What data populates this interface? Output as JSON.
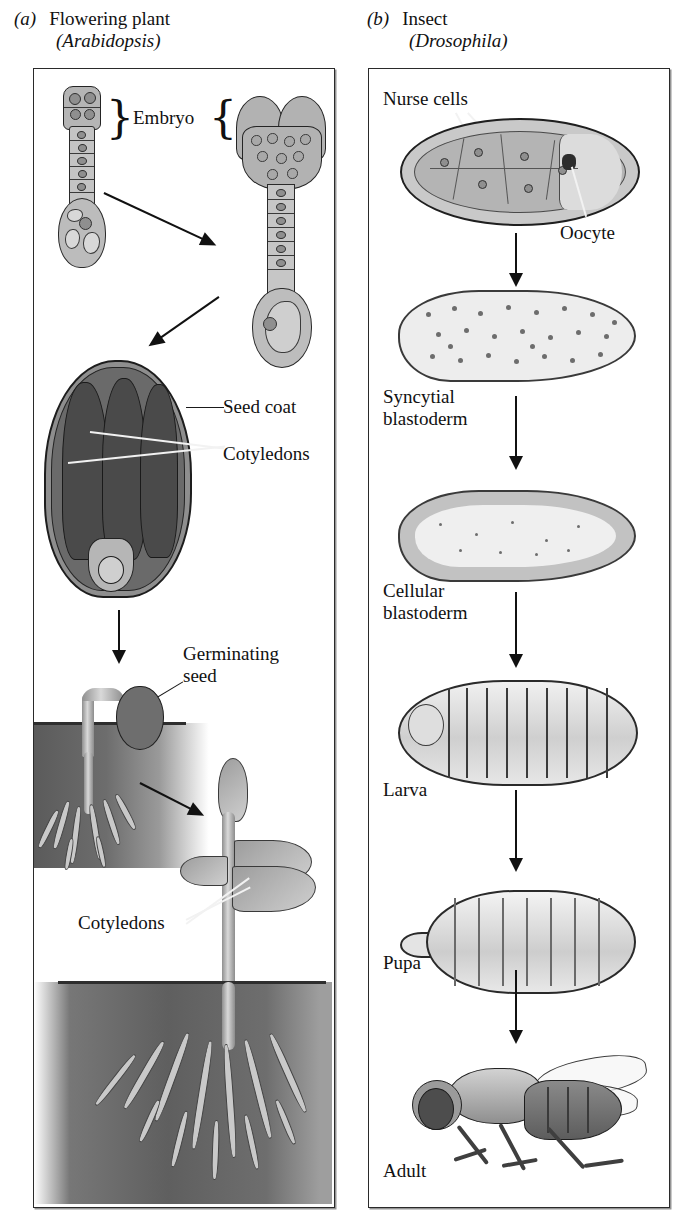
{
  "figure": {
    "type": "comparative-development-diagram",
    "panels": [
      {
        "tag": "(a)",
        "title": "Flowering plant",
        "organism": "(Arabidopsis)",
        "labels": {
          "embryo": "Embryo",
          "seed_coat": "Seed coat",
          "cotyledons_seed": "Cotyledons",
          "germinating_seed_line1": "Germinating",
          "germinating_seed_line2": "seed",
          "cotyledons_seedling": "Cotyledons"
        },
        "stages": [
          "early globular embryo with suspensor",
          "heart-stage embryo with suspensor",
          "mature seed",
          "germinating seedling in soil",
          "young seedling with cotyledons"
        ]
      },
      {
        "tag": "(b)",
        "title": "Insect",
        "organism": "(Drosophila)",
        "labels": {
          "nurse_cells": "Nurse cells",
          "oocyte": "Oocyte",
          "syncytial_line1": "Syncytial",
          "syncytial_line2": "blastoderm",
          "cellular_line1": "Cellular",
          "cellular_line2": "blastoderm",
          "larva": "Larva",
          "pupa": "Pupa",
          "adult": "Adult"
        },
        "stages": [
          "egg chamber with nurse cells and oocyte",
          "syncytial blastoderm",
          "cellular blastoderm",
          "larva",
          "pupa",
          "adult"
        ]
      }
    ],
    "colors": {
      "ink": "#111111",
      "frame": "#2a2a2a",
      "paper": "#ffffff",
      "tissue_mid": "#b9b9b9",
      "tissue_dark": "#4a4a4a",
      "soil_dark": "#5b5b5b"
    }
  }
}
